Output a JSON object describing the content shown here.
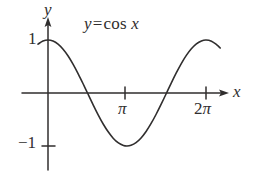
{
  "figure": {
    "kind": "math-function-graph",
    "background_color": "#ffffff",
    "ink_color": "#302e2e",
    "annotation": {
      "lhs": "y",
      "equals": "=",
      "function_name": "cos",
      "argument": "x",
      "full_text": "y = cos x"
    },
    "axes": {
      "y_axis_label": "y",
      "x_axis_label": "x",
      "y_ticks": [
        {
          "label": "1",
          "value": 1
        },
        {
          "label": "−1",
          "value": -1
        }
      ],
      "x_ticks": [
        {
          "label": "π",
          "value": 3.14159
        },
        {
          "label": "2",
          "pi": "π",
          "value": 6.28319
        }
      ]
    }
  },
  "chart_data": {
    "type": "line",
    "xlabel": "x",
    "ylabel": "y",
    "xlim": [
      -0.45,
      6.95
    ],
    "ylim": [
      -1.35,
      1.35
    ],
    "grid": false,
    "legend": "none",
    "xtick_values": [
      3.14159,
      6.28319
    ],
    "xtick_labels": [
      "π",
      "2π"
    ],
    "ytick_values": [
      1,
      -1
    ],
    "ytick_labels": [
      "1",
      "−1"
    ],
    "series": [
      {
        "name": "y = cos x",
        "color": "#302e2e",
        "x": [
          -0.4,
          -0.2,
          0.0,
          0.2,
          0.4,
          0.6,
          0.8,
          1.0,
          1.2,
          1.4,
          1.5708,
          1.8,
          2.0,
          2.2,
          2.4,
          2.6,
          2.8,
          3.0,
          3.14159,
          3.3,
          3.5,
          3.7,
          3.9,
          4.1,
          4.3,
          4.5,
          4.7124,
          4.9,
          5.1,
          5.3,
          5.5,
          5.7,
          5.9,
          6.1,
          6.28319,
          6.5,
          6.7,
          6.85
        ],
        "y": [
          0.921,
          0.98,
          1.0,
          0.98,
          0.921,
          0.825,
          0.697,
          0.54,
          0.362,
          0.17,
          0.0,
          -0.227,
          -0.416,
          -0.589,
          -0.737,
          -0.857,
          -0.942,
          -0.99,
          -1.0,
          -0.987,
          -0.936,
          -0.848,
          -0.726,
          -0.575,
          -0.401,
          -0.211,
          0.0,
          0.187,
          0.378,
          0.555,
          0.709,
          0.834,
          0.927,
          0.983,
          1.0,
          0.977,
          0.913,
          0.849
        ]
      }
    ],
    "key_points": {
      "maximum_y": 1,
      "minimum_y": -1,
      "zero_crossings_x": [
        1.5708,
        4.7124
      ],
      "period": 6.28319,
      "amplitude": 1
    }
  }
}
